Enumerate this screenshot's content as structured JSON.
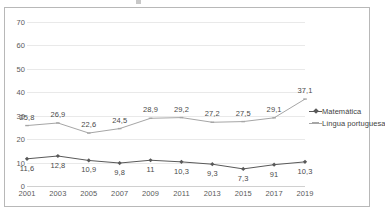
{
  "chart_data": {
    "type": "line",
    "title": "",
    "xlabel": "",
    "ylabel": "",
    "categories": [
      "2001",
      "2003",
      "2005",
      "2007",
      "2009",
      "2011",
      "2013",
      "2015",
      "2017",
      "2019"
    ],
    "ylim": [
      0,
      70
    ],
    "yticks": [
      0,
      10,
      20,
      30,
      40,
      50,
      60,
      70
    ],
    "ytick_labels": [
      "0",
      "10",
      "20",
      "30",
      "40",
      "50",
      "60",
      "70"
    ],
    "grid": true,
    "legend_position": "right",
    "series": [
      {
        "name": "Matemática",
        "color": "#595959",
        "marker": "diamond",
        "label_position": "below",
        "values": [
          11.6,
          12.8,
          10.9,
          9.8,
          11.0,
          10.3,
          9.3,
          7.3,
          9.1,
          10.3
        ],
        "data_labels": [
          "11,6",
          "12,8",
          "10,9",
          "9,8",
          "11",
          "10,3",
          "9,3",
          "7,3",
          "91",
          "10,3"
        ]
      },
      {
        "name": "Língua portuguesa",
        "color": "#a6a6a6",
        "marker": "dash",
        "label_position": "above",
        "values": [
          25.8,
          26.9,
          22.6,
          24.5,
          28.9,
          29.2,
          27.2,
          27.5,
          29.1,
          37.1
        ],
        "data_labels": [
          "25,8",
          "26,9",
          "22,6",
          "24,5",
          "28,9",
          "29,2",
          "27,2",
          "27,5",
          "29,1",
          "37,1"
        ]
      }
    ]
  },
  "legend": {
    "items": [
      {
        "label": "Matemática",
        "color": "#595959"
      },
      {
        "label": "Língua portuguesa",
        "color": "#a6a6a6"
      }
    ]
  }
}
